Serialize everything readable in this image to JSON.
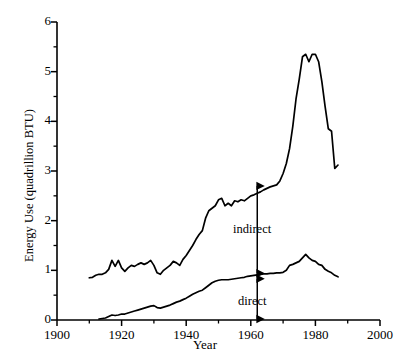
{
  "chart_data": {
    "type": "line",
    "title": "",
    "xlabel": "Year",
    "ylabel": "Energy Use (quadrillion BTU)",
    "xlim": [
      1900,
      2000
    ],
    "ylim": [
      0,
      6
    ],
    "xticks": [
      "1900",
      "1920",
      "1940",
      "1960",
      "1980",
      "2000"
    ],
    "xtick_values": [
      1900,
      1920,
      1940,
      1960,
      1980,
      2000
    ],
    "yticks": [
      "0",
      "1",
      "2",
      "3",
      "4",
      "5",
      "6"
    ],
    "ytick_values": [
      0,
      1,
      2,
      3,
      4,
      5,
      6
    ],
    "grid": false,
    "legend": "none",
    "minor_ticks_y": [
      0.5,
      1.5,
      2.5,
      3.5,
      4.5,
      5.5
    ],
    "minor_ticks_x": [
      1910,
      1930,
      1950,
      1970,
      1990
    ],
    "line_color": "#000000",
    "series": [
      {
        "name": "indirect",
        "x": [
          1910,
          1911,
          1912,
          1913,
          1914,
          1915,
          1916,
          1917,
          1918,
          1919,
          1920,
          1921,
          1922,
          1923,
          1924,
          1925,
          1926,
          1927,
          1928,
          1929,
          1930,
          1931,
          1932,
          1933,
          1934,
          1935,
          1936,
          1937,
          1938,
          1939,
          1940,
          1941,
          1942,
          1943,
          1944,
          1945,
          1946,
          1947,
          1948,
          1949,
          1950,
          1951,
          1952,
          1953,
          1954,
          1955,
          1956,
          1957,
          1958,
          1959,
          1960,
          1961,
          1962,
          1963,
          1964,
          1965,
          1966,
          1967,
          1968,
          1969,
          1970,
          1971,
          1972,
          1973,
          1974,
          1975,
          1976,
          1977,
          1978,
          1979,
          1980,
          1981,
          1982,
          1983,
          1984,
          1985,
          1986,
          1987
        ],
        "values": [
          0.85,
          0.86,
          0.9,
          0.92,
          0.92,
          0.95,
          1.02,
          1.2,
          1.08,
          1.2,
          1.05,
          0.98,
          1.05,
          1.1,
          1.08,
          1.12,
          1.15,
          1.12,
          1.15,
          1.2,
          1.1,
          0.95,
          0.92,
          1.0,
          1.05,
          1.1,
          1.18,
          1.15,
          1.1,
          1.22,
          1.3,
          1.4,
          1.5,
          1.62,
          1.72,
          1.8,
          2.05,
          2.2,
          2.25,
          2.3,
          2.42,
          2.45,
          2.3,
          2.35,
          2.3,
          2.4,
          2.38,
          2.42,
          2.4,
          2.45,
          2.5,
          2.52,
          2.55,
          2.58,
          2.62,
          2.65,
          2.68,
          2.7,
          2.72,
          2.8,
          2.95,
          3.15,
          3.45,
          3.9,
          4.45,
          4.85,
          5.3,
          5.35,
          5.2,
          5.35,
          5.35,
          5.2,
          4.8,
          4.3,
          3.85,
          3.8,
          3.05,
          3.12
        ]
      },
      {
        "name": "direct",
        "x": [
          1913,
          1914,
          1915,
          1916,
          1917,
          1918,
          1919,
          1920,
          1921,
          1922,
          1923,
          1924,
          1925,
          1926,
          1927,
          1928,
          1929,
          1930,
          1931,
          1932,
          1933,
          1934,
          1935,
          1936,
          1937,
          1938,
          1939,
          1940,
          1941,
          1942,
          1943,
          1944,
          1945,
          1946,
          1947,
          1948,
          1949,
          1950,
          1951,
          1952,
          1953,
          1954,
          1955,
          1956,
          1957,
          1958,
          1959,
          1960,
          1961,
          1962,
          1963,
          1964,
          1965,
          1966,
          1967,
          1968,
          1969,
          1970,
          1971,
          1972,
          1973,
          1974,
          1975,
          1976,
          1977,
          1978,
          1979,
          1980,
          1981,
          1982,
          1983,
          1984,
          1985,
          1986,
          1987
        ],
        "values": [
          0.02,
          0.03,
          0.04,
          0.07,
          0.1,
          0.09,
          0.1,
          0.12,
          0.12,
          0.14,
          0.16,
          0.18,
          0.2,
          0.22,
          0.24,
          0.26,
          0.28,
          0.29,
          0.25,
          0.24,
          0.26,
          0.28,
          0.3,
          0.33,
          0.36,
          0.38,
          0.41,
          0.44,
          0.48,
          0.52,
          0.55,
          0.58,
          0.6,
          0.65,
          0.7,
          0.75,
          0.78,
          0.8,
          0.81,
          0.81,
          0.81,
          0.82,
          0.83,
          0.84,
          0.85,
          0.86,
          0.88,
          0.89,
          0.9,
          0.91,
          0.92,
          0.93,
          0.93,
          0.94,
          0.94,
          0.95,
          0.95,
          0.96,
          1.0,
          1.1,
          1.12,
          1.15,
          1.18,
          1.25,
          1.32,
          1.25,
          1.2,
          1.18,
          1.12,
          1.1,
          1.02,
          0.98,
          0.95,
          0.9,
          0.87
        ]
      }
    ],
    "annotations": [
      {
        "text": "indirect",
        "year": 1962,
        "from_value": 2.72,
        "to_value": 0.92,
        "arrow": "double"
      },
      {
        "text": "direct",
        "year": 1962,
        "from_value": 0.85,
        "to_value": 0.0,
        "arrow": "double"
      }
    ]
  }
}
